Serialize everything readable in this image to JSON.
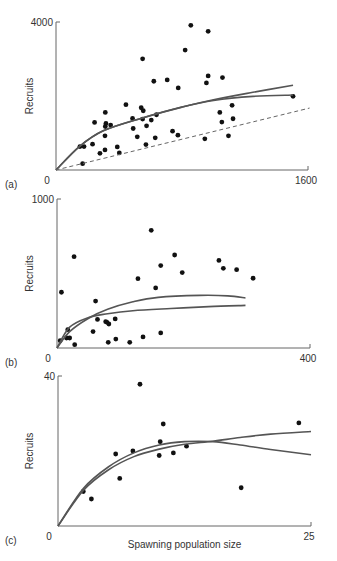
{
  "chart_data": [
    {
      "type": "scatter",
      "panel_label": "(a)",
      "title": "",
      "xlabel": "",
      "ylabel": "Recruits",
      "xlim": [
        0,
        1600
      ],
      "ylim": [
        0,
        4000
      ],
      "x_ticks": [
        "0",
        "1600"
      ],
      "y_ticks": [
        "4000"
      ],
      "grid": false,
      "series": [
        {
          "name": "observations",
          "type": "scatter",
          "points": [
            [
              152,
              633
            ],
            [
              178,
              633
            ],
            [
              232,
              697
            ],
            [
              169,
              172
            ],
            [
              279,
              452
            ],
            [
              311,
              543
            ],
            [
              245,
              1285
            ],
            [
              313,
              1557
            ],
            [
              313,
              1176
            ],
            [
              317,
              1258
            ],
            [
              347,
              1213
            ],
            [
              311,
              923
            ],
            [
              389,
              624
            ],
            [
              402,
              462
            ],
            [
              444,
              1765
            ],
            [
              486,
              1394
            ],
            [
              490,
              1122
            ],
            [
              516,
              896
            ],
            [
              541,
              1683
            ],
            [
              554,
              1602
            ],
            [
              550,
              3005
            ],
            [
              550,
              1376
            ],
            [
              575,
              1195
            ],
            [
              571,
              688
            ],
            [
              605,
              1348
            ],
            [
              621,
              2398
            ],
            [
              630,
              869
            ],
            [
              638,
              1493
            ],
            [
              706,
              2434
            ],
            [
              740,
              1050
            ],
            [
              774,
              941
            ],
            [
              776,
              2217
            ],
            [
              820,
              3240
            ],
            [
              856,
              3910
            ],
            [
              945,
              842
            ],
            [
              955,
              2353
            ],
            [
              966,
              2543
            ],
            [
              966,
              3747
            ],
            [
              1040,
              1557
            ],
            [
              1053,
              1294
            ],
            [
              1057,
              2498
            ],
            [
              1095,
              923
            ],
            [
              1118,
              1747
            ],
            [
              1124,
              1385
            ],
            [
              1505,
              1991
            ]
          ]
        },
        {
          "name": "fitted curve 1",
          "type": "line",
          "points": [
            [
              0,
              0
            ],
            [
              150,
              640
            ],
            [
              300,
              1060
            ],
            [
              543,
              1400
            ],
            [
              800,
              1700
            ],
            [
              1000,
              1900
            ],
            [
              1250,
              2100
            ],
            [
              1505,
              2290
            ]
          ]
        },
        {
          "name": "fitted curve 2",
          "type": "line",
          "points": [
            [
              0,
              0
            ],
            [
              150,
              640
            ],
            [
              300,
              1060
            ],
            [
              543,
              1400
            ],
            [
              800,
              1700
            ],
            [
              1000,
              1880
            ],
            [
              1250,
              1990
            ],
            [
              1505,
              2027
            ]
          ]
        },
        {
          "name": "replacement line",
          "type": "line",
          "style": "dashed",
          "points": [
            [
              0,
              0
            ],
            [
              1610,
              1674
            ]
          ]
        }
      ]
    },
    {
      "type": "scatter",
      "panel_label": "(b)",
      "title": "",
      "xlabel": "",
      "ylabel": "Recruits",
      "xlim": [
        0,
        400
      ],
      "ylim": [
        0,
        1000
      ],
      "x_ticks": [
        "0",
        "400"
      ],
      "y_ticks": [
        "1000"
      ],
      "grid": false,
      "series": [
        {
          "name": "observations",
          "type": "scatter",
          "points": [
            [
              5,
              49
            ],
            [
              7,
              374
            ],
            [
              17,
              123
            ],
            [
              15,
              67
            ],
            [
              20,
              67
            ],
            [
              27,
              613
            ],
            [
              28,
              22
            ],
            [
              57,
              110
            ],
            [
              61,
              315
            ],
            [
              64,
              192
            ],
            [
              77,
              177
            ],
            [
              79,
              172
            ],
            [
              82,
              161
            ],
            [
              92,
              195
            ],
            [
              81,
              38
            ],
            [
              93,
              60
            ],
            [
              115,
              38
            ],
            [
              128,
              465
            ],
            [
              136,
              74
            ],
            [
              149,
              790
            ],
            [
              156,
              403
            ],
            [
              164,
              553
            ],
            [
              164,
              101
            ],
            [
              186,
              624
            ],
            [
              198,
              506
            ],
            [
              256,
              588
            ],
            [
              263,
              535
            ],
            [
              284,
              526
            ],
            [
              310,
              468
            ]
          ]
        },
        {
          "name": "fitted curve 1",
          "type": "line",
          "points": [
            [
              0,
              0
            ],
            [
              20,
              110
            ],
            [
              50,
              200
            ],
            [
              80,
              260
            ],
            [
              120,
              310
            ],
            [
              160,
              340
            ],
            [
              226,
              353
            ],
            [
              270,
              350
            ],
            [
              298,
              336
            ]
          ]
        },
        {
          "name": "fitted curve 2",
          "type": "line",
          "points": [
            [
              0,
              0
            ],
            [
              20,
              140
            ],
            [
              50,
              205
            ],
            [
              80,
              230
            ],
            [
              120,
              250
            ],
            [
              180,
              265
            ],
            [
              240,
              278
            ],
            [
              298,
              286
            ]
          ]
        }
      ]
    },
    {
      "type": "scatter",
      "panel_label": "(c)",
      "title": "",
      "xlabel": "Spawning population size",
      "ylabel": "Recruits",
      "xlim": [
        0,
        25
      ],
      "ylim": [
        0,
        40
      ],
      "x_ticks": [
        "0",
        "25"
      ],
      "y_ticks": [
        "40"
      ],
      "grid": false,
      "series": [
        {
          "name": "observations",
          "type": "scatter",
          "points": [
            [
              2.5,
              9.2
            ],
            [
              3.3,
              7.2
            ],
            [
              5.7,
              19.2
            ],
            [
              6.1,
              12.7
            ],
            [
              7.4,
              20.0
            ],
            [
              8.1,
              37.8
            ],
            [
              10.0,
              18.8
            ],
            [
              10.1,
              22.5
            ],
            [
              10.4,
              27.2
            ],
            [
              11.4,
              19.5
            ],
            [
              12.7,
              21.3
            ],
            [
              18.1,
              10.2
            ],
            [
              23.8,
              27.5
            ]
          ]
        },
        {
          "name": "fitted curve 1",
          "type": "line",
          "points": [
            [
              0,
              0
            ],
            [
              2.5,
              9.5
            ],
            [
              5,
              15
            ],
            [
              7.5,
              18.5
            ],
            [
              10,
              20.5
            ],
            [
              12.5,
              21.8
            ],
            [
              15.3,
              22.6
            ],
            [
              18,
              23.6
            ],
            [
              21,
              24.5
            ],
            [
              25,
              25.2
            ]
          ]
        },
        {
          "name": "fitted curve 2",
          "type": "line",
          "points": [
            [
              0,
              0
            ],
            [
              2.5,
              10
            ],
            [
              5,
              15.8
            ],
            [
              7.5,
              19.5
            ],
            [
              10,
              21.6
            ],
            [
              12.5,
              22.5
            ],
            [
              15.3,
              22.5
            ],
            [
              18,
              21.6
            ],
            [
              21,
              20.4
            ],
            [
              25,
              19.0
            ]
          ]
        }
      ]
    }
  ]
}
